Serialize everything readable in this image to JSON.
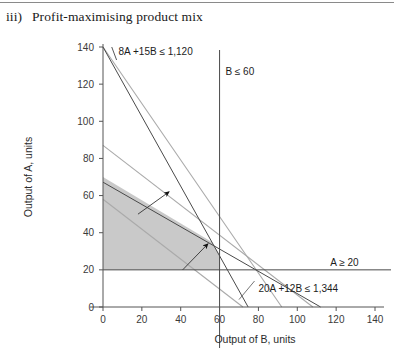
{
  "page": {
    "title_number": "iii)",
    "title_text": "Profit-maximising product mix"
  },
  "chart_data": {
    "type": "line",
    "title": "Profit-maximising product mix",
    "xlabel": "Output of B, units",
    "ylabel": "Output of A, units",
    "xlim": [
      0,
      140
    ],
    "ylim": [
      0,
      140
    ],
    "xticks": [
      0,
      20,
      40,
      60,
      80,
      100,
      120,
      140
    ],
    "yticks": [
      0,
      20,
      40,
      60,
      80,
      100,
      120,
      140
    ],
    "grid": false,
    "legend": "none",
    "constraints": [
      {
        "name": "materials",
        "label": "8A +15B  ≤ 1,120",
        "expression": "8A + 15B <= 1120",
        "y_intercept": 140,
        "x_intercept": 74.7,
        "label_x": 8,
        "label_y": 138
      },
      {
        "name": "labour",
        "label": "20A +12B  ≤ 1,344",
        "expression": "20A + 12B <= 1344",
        "y_intercept": 67.2,
        "x_intercept": 112,
        "label_x": 80,
        "label_y": 10
      },
      {
        "name": "demand-b",
        "label": "B ≤ 60",
        "expression": "B <= 60",
        "vertical_at_x": 60,
        "label_x": 63,
        "label_y": 127
      },
      {
        "name": "minimum-a",
        "label": "A ≥ 20",
        "expression": "A >= 20",
        "horizontal_at_y": 20,
        "label_x": 117,
        "label_y": 24
      }
    ],
    "isoprofit_lines": [
      {
        "name": "isoprofit-low",
        "from": [
          0,
          58
        ],
        "to": [
          72,
          0
        ]
      },
      {
        "name": "isoprofit-high",
        "from": [
          0,
          87
        ],
        "to": [
          108,
          0
        ]
      },
      {
        "name": "isoprofit-top",
        "from": [
          0,
          140
        ],
        "to": [
          92,
          0
        ]
      }
    ],
    "feasible_region": {
      "name": "feasible-region",
      "vertices": [
        [
          0,
          20
        ],
        [
          0,
          70
        ],
        [
          56,
          35
        ],
        [
          60,
          28
        ],
        [
          60,
          20
        ]
      ],
      "fill": "#c9c9c9"
    },
    "optimum_point": {
      "x": 56,
      "y": 35
    },
    "direction_arrows": [
      {
        "name": "isoprofit-direction-arrow-upper",
        "from": [
          18,
          50
        ],
        "to": [
          34,
          62
        ]
      },
      {
        "name": "isoprofit-direction-arrow-lower",
        "from": [
          41,
          20
        ],
        "to": [
          54,
          34
        ]
      }
    ]
  },
  "colors": {
    "axis": "#555555",
    "constraint_line": "#4a4a4a",
    "isoprofit_line": "#aaaaaa",
    "region_fill": "#c9c9c9",
    "text": "#1c1c1c"
  }
}
